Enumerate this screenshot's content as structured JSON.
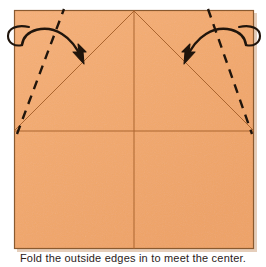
{
  "figure": {
    "type": "origami-fold-instruction",
    "background_color": "#ffffff",
    "caption_text": "Fold the outside edges in to meet the center."
  },
  "paper": {
    "name": "square-sheet",
    "fill_color": "#f3aa6e",
    "edge_color": "#8a5a30",
    "shadow_color": "#c0906a",
    "left": 14,
    "top": 10,
    "width": 240,
    "height": 239
  },
  "creases": [
    {
      "name": "vertical-center-crease",
      "style": "solid",
      "color": "#a8622c",
      "x1": 134,
      "y1": 10,
      "x2": 134,
      "y2": 249
    },
    {
      "name": "horizontal-center-crease",
      "style": "solid",
      "color": "#a8622c",
      "x1": 14,
      "y1": 131,
      "x2": 254,
      "y2": 131
    },
    {
      "name": "left-diagonal-crease",
      "style": "solid",
      "color": "#a8622c",
      "x1": 14,
      "y1": 131,
      "x2": 134,
      "y2": 11
    },
    {
      "name": "right-diagonal-crease",
      "style": "solid",
      "color": "#a8622c",
      "x1": 134,
      "y1": 11,
      "x2": 254,
      "y2": 131
    }
  ],
  "fold_lines": [
    {
      "name": "left-valley-fold-line",
      "style": "dashed",
      "color": "#20150c",
      "x1": 17,
      "y1": 133,
      "x2": 64,
      "y2": 10
    },
    {
      "name": "right-valley-fold-line",
      "style": "dashed",
      "color": "#20150c",
      "x1": 208,
      "y1": 10,
      "x2": 252,
      "y2": 133
    }
  ],
  "arrows": [
    {
      "name": "left-fold-arrow",
      "color": "#20150c",
      "direction": "inward-right",
      "loop_center_x": 19,
      "loop_center_y": 35,
      "tip_x": 84,
      "tip_y": 62
    },
    {
      "name": "right-fold-arrow",
      "color": "#20150c",
      "direction": "inward-left",
      "loop_center_x": 250,
      "loop_center_y": 35,
      "tip_x": 185,
      "tip_y": 62
    }
  ]
}
